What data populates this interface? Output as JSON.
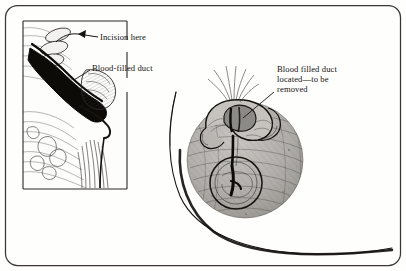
{
  "figure": {
    "name": "surgical-illustration-blood-filled-duct-excision",
    "background_color": "#fefefd",
    "ink_color": "#15120f",
    "shade_color": "#a9a6a2",
    "border": {
      "name": "figure-frame",
      "style": "rounded-rectangle",
      "corner_radius": 12,
      "stroke_color": "#3a3733"
    }
  },
  "inset": {
    "name": "cross-section-inset",
    "caption_present": false,
    "frame": {
      "left": 22,
      "top": 20,
      "right": 128,
      "bottom": 190,
      "stroke_color": "#2c2926"
    },
    "subject": "sagittal cross-section of nipple and lactiferous duct"
  },
  "labels": [
    {
      "id": "incision-here",
      "text": "Incision here",
      "lines": [
        "Incision here"
      ],
      "x": 100,
      "y": 32,
      "leader": "arrow pointing left to incision site in inset"
    },
    {
      "id": "blood-filled-duct",
      "text": "Blood-filled duct",
      "lines": [
        "Blood-filled duct"
      ],
      "x": 92,
      "y": 63,
      "leader": "line pointing left-down to darkened duct in inset"
    },
    {
      "id": "blood-filled-duct-located",
      "text": "Blood filled duct located—to be removed",
      "lines": [
        "Blood filled duct",
        "located—to be",
        "removed"
      ],
      "x": 277,
      "y": 64,
      "leader": "line pointing down-left to exposed duct at nipple"
    }
  ],
  "main_illustration": {
    "name": "breast-front-view",
    "areola": {
      "center_x": 245,
      "center_y": 160,
      "radius": 58,
      "shading": "fine cross-hatching",
      "fill": "#b4b1ad"
    },
    "nipple_flap": {
      "description": "everted nipple retracted, duct exposed"
    },
    "duct_ring": {
      "center_x": 236,
      "center_y": 183,
      "radius": 26,
      "description": "circular outline of isolated duct"
    },
    "breast_outline": {
      "description": "large sweeping contour arc from upper-middle to lower-right"
    }
  }
}
